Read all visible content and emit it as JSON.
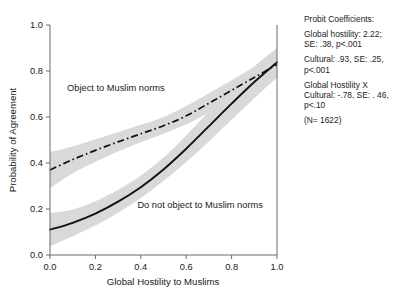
{
  "chart_data": {
    "type": "line",
    "title": "",
    "xlabel": "Global Hostility to Muslims",
    "ylabel": "Probability of Agreement",
    "xlim": [
      0.0,
      1.0
    ],
    "ylim": [
      0.0,
      1.0
    ],
    "xticks": [
      "0.0",
      "0.2",
      "0.4",
      "0.6",
      "0.8",
      "1.0"
    ],
    "yticks": [
      "0.0",
      "0.2",
      "0.4",
      "0.6",
      "0.8",
      "1.0"
    ],
    "grid": false,
    "legend_position": "inline-annotations",
    "x": [
      0.0,
      0.1,
      0.2,
      0.3,
      0.4,
      0.5,
      0.6,
      0.7,
      0.8,
      0.9,
      1.0
    ],
    "series": [
      {
        "name": "Object to Muslim norms",
        "style": "dash-dot",
        "color": "#111111",
        "values": [
          0.37,
          0.415,
          0.455,
          0.492,
          0.527,
          0.562,
          0.605,
          0.66,
          0.716,
          0.772,
          0.828
        ],
        "band_lower": [
          0.29,
          0.355,
          0.405,
          0.45,
          0.49,
          0.527,
          0.568,
          0.62,
          0.672,
          0.726,
          0.782
        ],
        "band_upper": [
          0.448,
          0.472,
          0.503,
          0.534,
          0.566,
          0.6,
          0.648,
          0.703,
          0.76,
          0.818,
          0.874
        ]
      },
      {
        "name": "Do not object to Muslim norms",
        "style": "solid",
        "color": "#111111",
        "values": [
          0.11,
          0.14,
          0.18,
          0.232,
          0.295,
          0.372,
          0.462,
          0.56,
          0.658,
          0.752,
          0.838
        ],
        "band_lower": [
          0.038,
          0.082,
          0.128,
          0.184,
          0.248,
          0.322,
          0.404,
          0.494,
          0.588,
          0.682,
          0.772
        ],
        "band_upper": [
          0.182,
          0.198,
          0.234,
          0.284,
          0.346,
          0.424,
          0.52,
          0.624,
          0.726,
          0.82,
          0.9
        ]
      }
    ],
    "annotations": [
      {
        "text": "Object to Muslim norms",
        "x": 0.075,
        "y": 0.715
      },
      {
        "text": "Do not object to Muslim norms",
        "x": 0.385,
        "y": 0.205
      }
    ],
    "colors": {
      "band_fill": "#d9d9d9",
      "curve": "#111111",
      "axis": "#6b6b6b",
      "text": "#1a1a1a",
      "background": "#ffffff"
    }
  },
  "stats_panel": {
    "heading": "Probit Coefficients:",
    "lines": [
      "Global hostility: 2.22;\nSE: .38, p<.001",
      "Cultural: .93, SE: .25,\np<.001",
      "Global Hostility X\nCultural: -.78, SE: . 46,\np<.10",
      "(N= 1622)"
    ]
  }
}
